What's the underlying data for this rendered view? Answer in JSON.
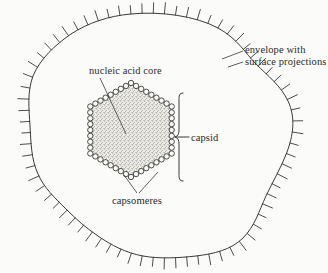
{
  "figure": {
    "background_color": "#fbfbf9",
    "ink_color": "#3a3a3a"
  },
  "labels": {
    "envelope_line1": "envelope with",
    "envelope_line2": "surface projections",
    "nucleic_acid_core": "nucleic acid core",
    "capsid": "capsid",
    "capsomeres": "capsomeres"
  },
  "parts": {
    "envelope": {
      "name": "envelope",
      "description": "irregular rounded outline with radial surface projections",
      "projection_count": 72
    },
    "capsid": {
      "name": "capsid",
      "description": "hexagonal shell built from capsomere circles",
      "capsomere_count": 48,
      "shape": "hexagon"
    },
    "core": {
      "name": "nucleic acid core",
      "description": "stippled hexagonal interior",
      "fill_color": "#d8d8d2"
    }
  },
  "chart_data": {
    "type": "diagram",
    "annotations": [
      "envelope with surface projections",
      "nucleic acid core",
      "capsid",
      "capsomeres"
    ]
  }
}
